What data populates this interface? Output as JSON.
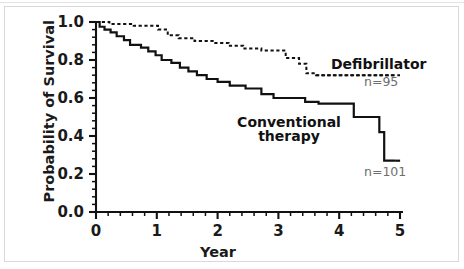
{
  "chart_data": {
    "type": "line",
    "subtype": "kaplan-meier-step",
    "title": "",
    "xlabel": "Year",
    "ylabel": "Probability of Survival",
    "xlim": [
      0,
      5
    ],
    "ylim": [
      0.0,
      1.0
    ],
    "xticks": [
      0,
      1,
      2,
      3,
      4,
      5
    ],
    "xtick_labels": [
      "0",
      "1",
      "2",
      "3",
      "4",
      "5"
    ],
    "x_minor_ticks_per_interval": 5,
    "yticks": [
      0.0,
      0.2,
      0.4,
      0.6,
      0.8,
      1.0
    ],
    "ytick_labels": [
      "0.0",
      "0.2",
      "0.4",
      "0.6",
      "0.8",
      "1.0"
    ],
    "y_minor_ticks_per_interval": 4,
    "grid": false,
    "legend_position": "inline-annotations",
    "series": [
      {
        "name": "Defibrillator",
        "label": "Defibrillator",
        "n_label": "n=95",
        "n": 95,
        "style": "dashed",
        "color": "#111111",
        "final_value": 0.72,
        "points": [
          [
            0.0,
            1.0
          ],
          [
            0.22,
            1.0
          ],
          [
            0.22,
            0.99
          ],
          [
            0.62,
            0.99
          ],
          [
            0.62,
            0.98
          ],
          [
            1.02,
            0.98
          ],
          [
            1.02,
            0.96
          ],
          [
            1.18,
            0.96
          ],
          [
            1.18,
            0.93
          ],
          [
            1.36,
            0.93
          ],
          [
            1.36,
            0.915
          ],
          [
            1.62,
            0.915
          ],
          [
            1.62,
            0.9
          ],
          [
            1.92,
            0.9
          ],
          [
            1.92,
            0.89
          ],
          [
            2.18,
            0.89
          ],
          [
            2.18,
            0.875
          ],
          [
            2.42,
            0.875
          ],
          [
            2.42,
            0.86
          ],
          [
            2.72,
            0.86
          ],
          [
            2.72,
            0.85
          ],
          [
            3.12,
            0.85
          ],
          [
            3.12,
            0.81
          ],
          [
            3.34,
            0.81
          ],
          [
            3.34,
            0.78
          ],
          [
            3.46,
            0.78
          ],
          [
            3.46,
            0.73
          ],
          [
            3.62,
            0.73
          ],
          [
            3.62,
            0.72
          ],
          [
            4.92,
            0.72
          ]
        ]
      },
      {
        "name": "Conventional therapy",
        "label": "Conventional\ntherapy",
        "n_label": "n=101",
        "n": 101,
        "style": "solid",
        "color": "#111111",
        "final_value": 0.27,
        "points": [
          [
            0.0,
            1.0
          ],
          [
            0.06,
            1.0
          ],
          [
            0.06,
            0.975
          ],
          [
            0.14,
            0.975
          ],
          [
            0.14,
            0.96
          ],
          [
            0.24,
            0.96
          ],
          [
            0.24,
            0.945
          ],
          [
            0.34,
            0.945
          ],
          [
            0.34,
            0.925
          ],
          [
            0.46,
            0.925
          ],
          [
            0.46,
            0.905
          ],
          [
            0.56,
            0.905
          ],
          [
            0.56,
            0.88
          ],
          [
            0.74,
            0.88
          ],
          [
            0.74,
            0.865
          ],
          [
            0.86,
            0.865
          ],
          [
            0.86,
            0.845
          ],
          [
            0.98,
            0.845
          ],
          [
            0.98,
            0.825
          ],
          [
            1.08,
            0.825
          ],
          [
            1.08,
            0.8
          ],
          [
            1.24,
            0.8
          ],
          [
            1.24,
            0.785
          ],
          [
            1.38,
            0.785
          ],
          [
            1.38,
            0.76
          ],
          [
            1.52,
            0.76
          ],
          [
            1.52,
            0.74
          ],
          [
            1.66,
            0.74
          ],
          [
            1.66,
            0.72
          ],
          [
            1.82,
            0.72
          ],
          [
            1.82,
            0.7
          ],
          [
            2.0,
            0.7
          ],
          [
            2.0,
            0.685
          ],
          [
            2.2,
            0.685
          ],
          [
            2.2,
            0.665
          ],
          [
            2.46,
            0.665
          ],
          [
            2.46,
            0.65
          ],
          [
            2.72,
            0.65
          ],
          [
            2.72,
            0.62
          ],
          [
            2.92,
            0.62
          ],
          [
            2.92,
            0.6
          ],
          [
            3.44,
            0.6
          ],
          [
            3.44,
            0.58
          ],
          [
            3.66,
            0.58
          ],
          [
            3.66,
            0.57
          ],
          [
            4.24,
            0.57
          ],
          [
            4.24,
            0.5
          ],
          [
            4.66,
            0.5
          ],
          [
            4.66,
            0.42
          ],
          [
            4.74,
            0.42
          ],
          [
            4.74,
            0.27
          ],
          [
            4.92,
            0.27
          ]
        ]
      }
    ]
  }
}
